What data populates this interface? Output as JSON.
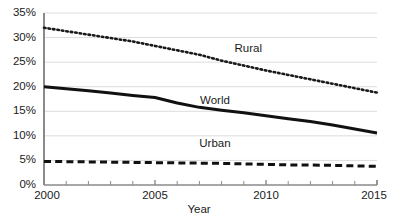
{
  "chart_data": {
    "type": "line",
    "title": "",
    "xlabel": "Year",
    "ylabel": "",
    "xlim": [
      2000,
      2015
    ],
    "ylim": [
      0,
      35
    ],
    "grid": true,
    "grid_axis": "y",
    "legend_position": "inline-labels",
    "x_tick_labels": [
      "2000",
      "2005",
      "2010",
      "2015"
    ],
    "x_tick_values": [
      2000,
      2005,
      2010,
      2015
    ],
    "x_minor_ticks": [
      2001,
      2002,
      2003,
      2004,
      2006,
      2007,
      2008,
      2009,
      2011,
      2012,
      2013,
      2014
    ],
    "y_tick_labels": [
      "0%",
      "5%",
      "10%",
      "15%",
      "20%",
      "25%",
      "30%",
      "35%"
    ],
    "y_tick_values": [
      0,
      5,
      10,
      15,
      20,
      25,
      30,
      35
    ],
    "x": [
      2000,
      2001,
      2002,
      2003,
      2004,
      2005,
      2006,
      2007,
      2008,
      2009,
      2010,
      2011,
      2012,
      2013,
      2014,
      2015
    ],
    "series": [
      {
        "name": "Rural",
        "style": "dotted",
        "color": "#1a1a1a",
        "values": [
          32.0,
          31.3,
          30.6,
          29.9,
          29.2,
          28.3,
          27.4,
          26.5,
          25.3,
          24.3,
          23.3,
          22.4,
          21.5,
          20.6,
          19.7,
          18.8
        ]
      },
      {
        "name": "World",
        "style": "solid",
        "color": "#111111",
        "values": [
          20.0,
          19.6,
          19.2,
          18.7,
          18.2,
          17.8,
          16.7,
          15.8,
          15.2,
          14.7,
          14.1,
          13.5,
          12.9,
          12.2,
          11.4,
          10.6
        ]
      },
      {
        "name": "Urban",
        "style": "dashed",
        "color": "#111111",
        "values": [
          4.8,
          4.75,
          4.7,
          4.65,
          4.6,
          4.55,
          4.5,
          4.45,
          4.4,
          4.3,
          4.2,
          4.1,
          4.05,
          4.0,
          3.9,
          3.8
        ]
      }
    ],
    "annotations": [
      {
        "text": "Rural",
        "x": 2009.2,
        "y": 27.6
      },
      {
        "text": "World",
        "x": 2007.7,
        "y": 17.0
      },
      {
        "text": "Urban",
        "x": 2007.7,
        "y": 8.4
      }
    ]
  }
}
